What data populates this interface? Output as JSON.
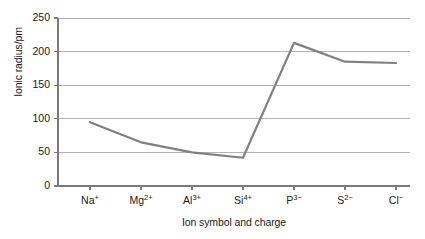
{
  "chart_data": {
    "type": "line",
    "title": "",
    "xlabel": "Ion symbol and charge",
    "ylabel": "Ionic radius/pm",
    "categories": [
      "Na+",
      "Mg2+",
      "Al3+",
      "Si4+",
      "P3-",
      "S2-",
      "Cl-"
    ],
    "categories_display": [
      {
        "symbol": "Na",
        "charge": "+"
      },
      {
        "symbol": "Mg",
        "charge": "2+"
      },
      {
        "symbol": "Al",
        "charge": "3+"
      },
      {
        "symbol": "Si",
        "charge": "4+"
      },
      {
        "symbol": "P",
        "charge": "3−"
      },
      {
        "symbol": "S",
        "charge": "2−"
      },
      {
        "symbol": "Cl",
        "charge": "−"
      }
    ],
    "values": [
      95,
      65,
      50,
      42,
      213,
      185,
      183
    ],
    "ylim": [
      0,
      250
    ],
    "yticks": [
      0,
      50,
      100,
      150,
      200,
      250
    ],
    "ytick_labels": [
      "0",
      "50",
      "100",
      "150",
      "200",
      "250"
    ],
    "grid": "horizontal",
    "legend": "none",
    "series_color": "#808080",
    "grid_color": "#b3b3b3",
    "axis_color": "#7a7a7a",
    "background": "#ffffff"
  },
  "axes": {
    "ylabel_text": "Ionic radius/pm",
    "xlabel_text": "Ion symbol and charge"
  }
}
